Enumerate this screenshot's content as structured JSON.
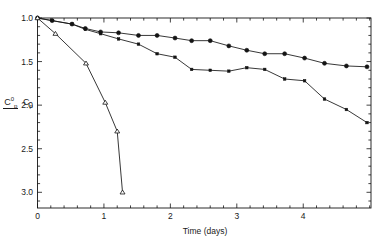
{
  "chart_data": {
    "type": "line",
    "title": "",
    "xlabel": "Time (days)",
    "ylabel_numerator": "C",
    "ylabel_numerator_sup": "0",
    "ylabel_numerator_sub": "p",
    "ylabel_denominator": "C",
    "ylabel_denominator_sub": "p",
    "ylabel_plain": "C0p / Cp",
    "xlim": [
      0,
      5.02
    ],
    "ylim": [
      1.0,
      3.18
    ],
    "y_inverted": true,
    "grid": false,
    "legend": "none",
    "xticks": [
      0,
      1,
      2,
      3,
      4
    ],
    "xtick_labels": [
      "0",
      "1",
      "2",
      "3",
      "4"
    ],
    "x_minor_step": 0.2,
    "yticks": [
      1.0,
      1.5,
      2.0,
      2.5,
      3.0
    ],
    "ytick_labels": [
      "1.0",
      "1.5",
      "2.0",
      "2.5",
      "3.0"
    ],
    "y_minor_step": 0.1,
    "frame": "box",
    "series": [
      {
        "name": "filled-circles",
        "marker": "filled-circle",
        "marker_size": 4.0,
        "color": "#141414",
        "x": [
          0.0,
          0.22,
          0.52,
          0.72,
          0.95,
          1.22,
          1.52,
          1.8,
          2.07,
          2.32,
          2.6,
          2.88,
          3.15,
          3.42,
          3.72,
          4.02,
          4.32,
          4.65,
          4.96
        ],
        "y": [
          1.0,
          1.03,
          1.07,
          1.12,
          1.16,
          1.17,
          1.2,
          1.2,
          1.23,
          1.26,
          1.26,
          1.32,
          1.37,
          1.41,
          1.41,
          1.46,
          1.52,
          1.55,
          1.56
        ]
      },
      {
        "name": "small-squares",
        "marker": "filled-square",
        "marker_size": 2.6,
        "color": "#141414",
        "x": [
          0.0,
          0.22,
          0.52,
          0.72,
          0.95,
          1.22,
          1.52,
          1.8,
          2.07,
          2.32,
          2.6,
          2.88,
          3.15,
          3.42,
          3.72,
          4.02,
          4.32,
          4.65,
          4.96
        ],
        "y": [
          1.0,
          1.03,
          1.07,
          1.13,
          1.18,
          1.24,
          1.3,
          1.41,
          1.45,
          1.59,
          1.6,
          1.61,
          1.57,
          1.59,
          1.7,
          1.72,
          1.93,
          2.05,
          2.2
        ]
      },
      {
        "name": "open-triangles",
        "marker": "open-triangle",
        "marker_size": 4.0,
        "color": "#141414",
        "x": [
          0.0,
          0.27,
          0.73,
          1.02,
          1.2,
          1.28
        ],
        "y": [
          1.0,
          1.18,
          1.52,
          1.97,
          2.3,
          3.0
        ]
      }
    ]
  }
}
